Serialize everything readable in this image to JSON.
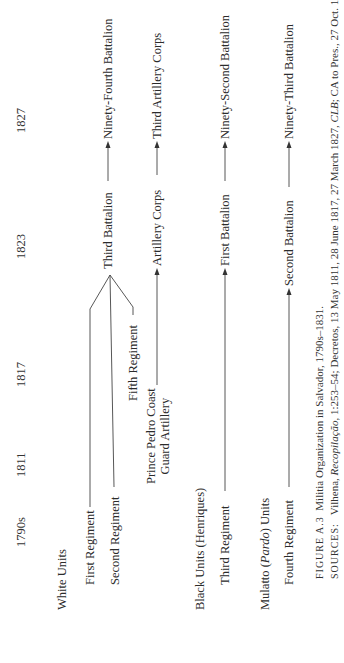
{
  "years": [
    "1790s",
    "1811",
    "1817",
    "1823",
    "1827"
  ],
  "groups": {
    "white": "White Units",
    "black": "Black Units (Henriques)",
    "mulatto_prefix": "Mulatto (",
    "mulatto_italic": "Pardo",
    "mulatto_suffix": ") Units"
  },
  "units": {
    "first_regiment": "First Regiment",
    "second_regiment": "Second Regiment",
    "fifth_regiment": "Fifth Regiment",
    "prince_pedro_line1": "Prince Pedro Coast",
    "prince_pedro_line2": "Guard Artillery",
    "third_battalion": "Third Battalion",
    "artillery_corps": "Artillery Corps",
    "ninety_fourth": "Ninety-Fourth Battalion",
    "third_artillery_corps": "Third Artillery Corps",
    "third_regiment": "Third Regiment",
    "first_battalion": "First Battalion",
    "ninety_second": "Ninety-Second Battalion",
    "fourth_regiment": "Fourth Regiment",
    "second_battalion": "Second Battalion",
    "ninety_third": "Ninety-Third Battalion"
  },
  "caption": {
    "figure_label": "FIGURE A.3",
    "figure_title": "Militia Organization in Salvador, 1790s–1831.",
    "sources_label": "SOURCES:",
    "sources_text_1": "Vilhena, ",
    "sources_italic_1": "Recopilação",
    "sources_text_2": ", 1:253–54; Decretos, 13 May 1811, 28 June 1817, 27 March 1827, ",
    "sources_italic_2": "CLB",
    "sources_text_3": "; CA to Pres., 27 Oct. 1830,"
  }
}
